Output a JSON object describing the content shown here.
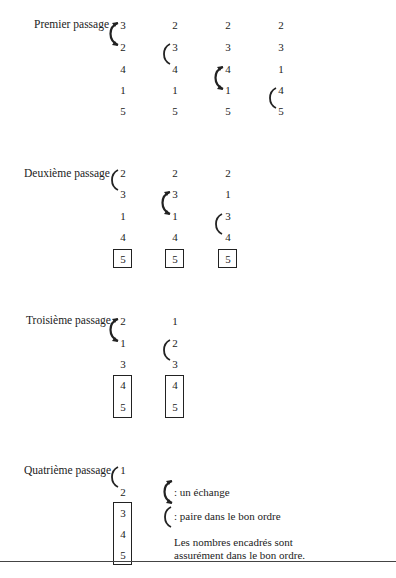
{
  "passes": [
    {
      "label": "Premier passage",
      "columns": [
        [
          "3",
          "2",
          "4",
          "1",
          "5"
        ],
        [
          "2",
          "3",
          "4",
          "1",
          "5"
        ],
        [
          "2",
          "3",
          "4",
          "1",
          "5"
        ],
        [
          "2",
          "3",
          "1",
          "4",
          "5"
        ]
      ]
    },
    {
      "label": "Deuxième passage",
      "columns": [
        [
          "2",
          "3",
          "1",
          "4",
          "5"
        ],
        [
          "2",
          "3",
          "1",
          "4",
          "5"
        ],
        [
          "2",
          "1",
          "3",
          "4",
          "5"
        ]
      ]
    },
    {
      "label": "Troisième passage",
      "columns": [
        [
          "2",
          "1",
          "3",
          "4",
          "5"
        ],
        [
          "1",
          "2",
          "3",
          "4",
          "5"
        ]
      ]
    },
    {
      "label": "Quatrième passage",
      "columns": [
        [
          "1",
          "2",
          "3",
          "4",
          "5"
        ]
      ]
    }
  ],
  "legend": {
    "swap": ": un échange",
    "ordered": ": paire dans le bon ordre",
    "boxed_line1": "Les nombres encadrés sont",
    "boxed_line2": "assurément dans le bon ordre."
  }
}
